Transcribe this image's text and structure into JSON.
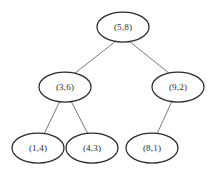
{
  "diagram": {
    "background_color": "#ffffff",
    "node_fill": "#ffffff",
    "node_stroke": "#2b2b2b",
    "edge_color": "#6a6a6a",
    "text_color": "#2e2e2e",
    "width": 217,
    "height": 172
  },
  "nodes": [
    {
      "id": "root",
      "label": "(5,8)",
      "cx": 123,
      "cy": 27,
      "rx": 26,
      "ry": 15,
      "level": 0
    },
    {
      "id": "n-3-6",
      "label": "(3,6)",
      "cx": 65,
      "cy": 87,
      "rx": 26,
      "ry": 15,
      "level": 1
    },
    {
      "id": "n-9-2",
      "label": "(9,2)",
      "cx": 178,
      "cy": 87,
      "rx": 26,
      "ry": 15,
      "level": 1
    },
    {
      "id": "n-1-4",
      "label": "(1,4)",
      "cx": 38,
      "cy": 148,
      "rx": 26,
      "ry": 15,
      "level": 2
    },
    {
      "id": "n-4-3",
      "label": "(4,3)",
      "cx": 92,
      "cy": 148,
      "rx": 26,
      "ry": 15,
      "level": 2
    },
    {
      "id": "n-8-1",
      "label": "(8,1)",
      "cx": 152,
      "cy": 148,
      "rx": 26,
      "ry": 15,
      "level": 2
    }
  ],
  "edges": [
    {
      "id": "e-root-left",
      "from": "root",
      "to": "n-3-6",
      "x1": 116,
      "y1": 41,
      "x2": 74,
      "y2": 74
    },
    {
      "id": "e-root-right",
      "from": "root",
      "to": "n-9-2",
      "x1": 129,
      "y1": 41,
      "x2": 170,
      "y2": 74
    },
    {
      "id": "e-36-left",
      "from": "n-3-6",
      "to": "n-1-4",
      "x1": 60,
      "y1": 101,
      "x2": 44,
      "y2": 134
    },
    {
      "id": "e-36-right",
      "from": "n-3-6",
      "to": "n-4-3",
      "x1": 71,
      "y1": 101,
      "x2": 88,
      "y2": 134
    },
    {
      "id": "e-92-left",
      "from": "n-9-2",
      "to": "n-8-1",
      "x1": 172,
      "y1": 101,
      "x2": 157,
      "y2": 134
    }
  ]
}
